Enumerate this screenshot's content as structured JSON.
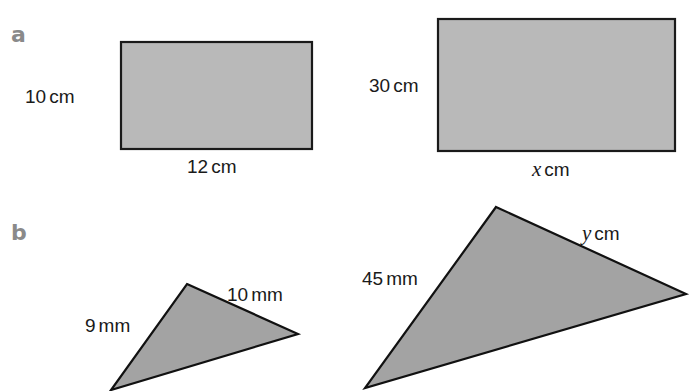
{
  "colors": {
    "rect_fill": "#b9b9b9",
    "triangle_fill": "#a3a3a3",
    "stroke": "#1a1a1a",
    "part_label": "#8a8a8a",
    "text": "#1a1a1a"
  },
  "parts": [
    {
      "label": "a",
      "label_pos": [
        11,
        42
      ],
      "shapes": [
        {
          "type": "rectangle",
          "x": 121,
          "y": 42,
          "width": 191,
          "height": 107,
          "dimensions": [
            {
              "value": "10",
              "variable": "",
              "unit": "cm",
              "side": "left",
              "x": 25,
              "y": 103,
              "anchor": "start"
            },
            {
              "value": "12",
              "variable": "",
              "unit": "cm",
              "side": "bottom",
              "x": 187,
              "y": 173,
              "anchor": "start"
            }
          ]
        },
        {
          "type": "rectangle",
          "x": 438,
          "y": 19,
          "width": 237,
          "height": 132,
          "dimensions": [
            {
              "value": "30",
              "variable": "",
              "unit": "cm",
              "side": "left",
              "x": 369,
              "y": 92,
              "anchor": "start"
            },
            {
              "value": "",
              "variable": "x",
              "unit": "cm",
              "side": "bottom",
              "x": 532,
              "y": 176,
              "anchor": "start"
            }
          ]
        }
      ]
    },
    {
      "label": "b",
      "label_pos": [
        11,
        240
      ],
      "shapes": [
        {
          "type": "triangle",
          "points": [
            [
              187,
              284
            ],
            [
              298,
              334
            ],
            [
              111,
              390
            ]
          ],
          "dimensions": [
            {
              "value": "9",
              "variable": "",
              "unit": "mm",
              "side": "left",
              "x": 85,
              "y": 332,
              "anchor": "start"
            },
            {
              "value": "10",
              "variable": "",
              "unit": "mm",
              "side": "upper-right",
              "x": 227,
              "y": 301,
              "anchor": "start"
            }
          ]
        },
        {
          "type": "triangle",
          "points": [
            [
              496,
              207
            ],
            [
              686,
              294
            ],
            [
              365,
              388
            ]
          ],
          "dimensions": [
            {
              "value": "45",
              "variable": "",
              "unit": "mm",
              "side": "left",
              "x": 362,
              "y": 285,
              "anchor": "start"
            },
            {
              "value": "",
              "variable": "y",
              "unit": "cm",
              "side": "upper-right",
              "x": 582,
              "y": 240,
              "anchor": "start"
            }
          ]
        }
      ]
    }
  ]
}
